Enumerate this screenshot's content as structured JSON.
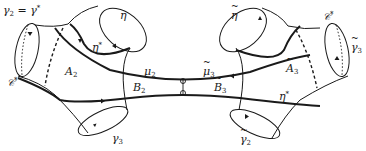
{
  "diagram": {
    "type": "surface-decomposition",
    "colors": {
      "stroke": "#1a1a1a",
      "background": "#ffffff"
    },
    "labels": {
      "gamma2_eq": {
        "base": "γ",
        "sub": "2",
        "rest": " = γ",
        "sup": "*"
      },
      "eta": {
        "base": "η"
      },
      "eta_star_left": {
        "base": "η",
        "sup": "*"
      },
      "C_star_left": {
        "base": "𝒞",
        "sup": "*"
      },
      "A2": {
        "base": "A",
        "sub": "2"
      },
      "mu2": {
        "base": "μ",
        "sub": "2"
      },
      "B2": {
        "base": "B",
        "sub": "2"
      },
      "gamma3": {
        "base": "γ",
        "sub": "3"
      },
      "eta_tilde": {
        "base": "η"
      },
      "C_star_right": {
        "base": "𝒞",
        "sup": "*"
      },
      "gamma3_tilde": {
        "base": "γ",
        "sub": "3"
      },
      "A3_tilde": {
        "base": "A",
        "sub": "3"
      },
      "mu3_tilde": {
        "base": "μ",
        "sub": "3"
      },
      "B3_tilde": {
        "base": "B",
        "sub": "3"
      },
      "eta_star_right": {
        "base": "η",
        "sup": "*"
      },
      "gamma2_tilde": {
        "base": "γ",
        "sub": "2"
      }
    },
    "nodes": [
      "γ2 = γ*",
      "η",
      "η*",
      "𝒞*",
      "A2",
      "μ2",
      "B2",
      "γ3",
      "η̃",
      "𝒞*",
      "γ̃3",
      "Ã3",
      "μ̃3",
      "B̃3",
      "η*",
      "γ̃2"
    ],
    "edges": [
      {
        "from": "μ2",
        "to": "μ̃3",
        "label": "central connecting curve"
      },
      {
        "from": "B2",
        "to": "B̃3",
        "label": "lower connecting curve η*"
      }
    ]
  }
}
